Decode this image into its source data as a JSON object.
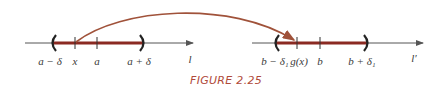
{
  "figure": {
    "caption": "FIGURE 2.25",
    "colors": {
      "axis": "#555555",
      "interval": "#8b2a22",
      "arc": "#a0523a",
      "caption": "#b04a3a",
      "label": "#3a3a3a"
    },
    "left_line": {
      "name": "l",
      "labels": {
        "left_endpoint": "a − δ",
        "point_x": "x",
        "center": "a",
        "right_endpoint": "a + δ"
      }
    },
    "right_line": {
      "name": "l′",
      "labels": {
        "left_endpoint": "b − δ₁",
        "point_gx": "g(x)",
        "center": "b",
        "right_endpoint": "b + δ₁"
      }
    },
    "mapping_arrow": "x ↦ g(x)"
  }
}
